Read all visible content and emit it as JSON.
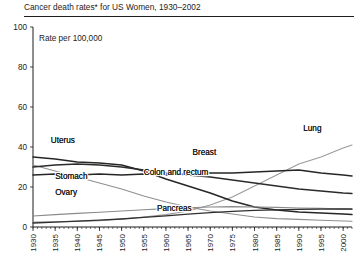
{
  "figure": {
    "title": "Cancer death rates* for US Women, 1930–2002",
    "axis_caption": "Rate per 100,000"
  },
  "chart_data": {
    "type": "line",
    "title": "Cancer death rates* for US Women, 1930–2002",
    "subtitle": "",
    "xlabel": "",
    "ylabel": "Rate per 100,000",
    "xlim": [
      1930,
      2002
    ],
    "ylim": [
      0,
      100
    ],
    "yticks": [
      0,
      20,
      40,
      60,
      80,
      100
    ],
    "xticks": [
      1930,
      1935,
      1940,
      1945,
      1950,
      1955,
      1960,
      1965,
      1970,
      1975,
      1980,
      1985,
      1990,
      1995,
      2000
    ],
    "xtick_labels": [
      "1930",
      "1935",
      "1940",
      "1945",
      "1950",
      "1955",
      "1960",
      "1965",
      "1970",
      "1975",
      "1980",
      "1985",
      "1990",
      "1995",
      "2000"
    ],
    "x_minor_tick_interval": 1,
    "grid": false,
    "legend": "inline-annotations",
    "x": [
      1930,
      1935,
      1940,
      1945,
      1950,
      1955,
      1960,
      1965,
      1970,
      1975,
      1980,
      1985,
      1990,
      1995,
      2000,
      2002
    ],
    "series": [
      {
        "name": "Lung",
        "color": "#9a9a9a",
        "width": 1.1,
        "label": "Lung",
        "label_x": 1991,
        "label_y": 48,
        "values": [
          2.5,
          2.6,
          2.8,
          3.2,
          4.0,
          5.0,
          6.2,
          8.0,
          11.0,
          15.0,
          20.5,
          26.0,
          31.5,
          35.0,
          39.5,
          41.0
        ]
      },
      {
        "name": "Breast",
        "color": "#262626",
        "width": 1.6,
        "label": "Breast",
        "label_x": 1966,
        "label_y": 36,
        "values": [
          26.0,
          26.5,
          26.0,
          26.5,
          26.0,
          26.5,
          26.0,
          26.5,
          27.0,
          27.0,
          27.5,
          28.0,
          28.5,
          27.0,
          26.0,
          25.5
        ]
      },
      {
        "name": "Uterus",
        "color": "#262626",
        "width": 1.5,
        "label": "Uterus",
        "label_x": 1934,
        "label_y": 42,
        "values": [
          35.0,
          34.0,
          32.5,
          32.0,
          31.0,
          28.0,
          24.0,
          20.5,
          17.0,
          13.0,
          10.0,
          8.5,
          7.5,
          7.0,
          6.5,
          6.2
        ]
      },
      {
        "name": "Stomach",
        "color": "#8f8f8f",
        "width": 1.1,
        "label": "Stomach",
        "label_x": 1935,
        "label_y": 24,
        "values": [
          31.0,
          28.0,
          25.0,
          22.0,
          19.0,
          15.5,
          12.5,
          10.0,
          8.0,
          6.5,
          5.0,
          4.2,
          3.8,
          3.4,
          3.0,
          2.9
        ]
      },
      {
        "name": "Colon and rectum",
        "color": "#2b2b2b",
        "width": 1.5,
        "label": "Colon and rectum",
        "label_x": 1955,
        "label_y": 26,
        "values": [
          30.0,
          31.0,
          31.5,
          31.0,
          30.0,
          28.5,
          27.0,
          26.0,
          25.0,
          23.5,
          22.0,
          20.5,
          19.0,
          18.0,
          17.0,
          16.8
        ]
      },
      {
        "name": "Ovary",
        "color": "#8a8a8a",
        "width": 1.1,
        "label": "Ovary",
        "label_x": 1935,
        "label_y": 16,
        "values": [
          5.5,
          6.2,
          6.8,
          7.4,
          8.0,
          8.6,
          9.2,
          9.6,
          10.0,
          10.2,
          10.0,
          9.8,
          9.5,
          9.3,
          9.0,
          8.9
        ]
      },
      {
        "name": "Pancreas",
        "color": "#303030",
        "width": 1.3,
        "label": "Pancreas",
        "label_x": 1958,
        "label_y": 8,
        "values": [
          2.0,
          2.4,
          2.9,
          3.4,
          4.0,
          4.8,
          5.6,
          6.4,
          7.2,
          7.8,
          8.3,
          8.6,
          8.8,
          8.9,
          9.0,
          9.0
        ]
      }
    ]
  }
}
